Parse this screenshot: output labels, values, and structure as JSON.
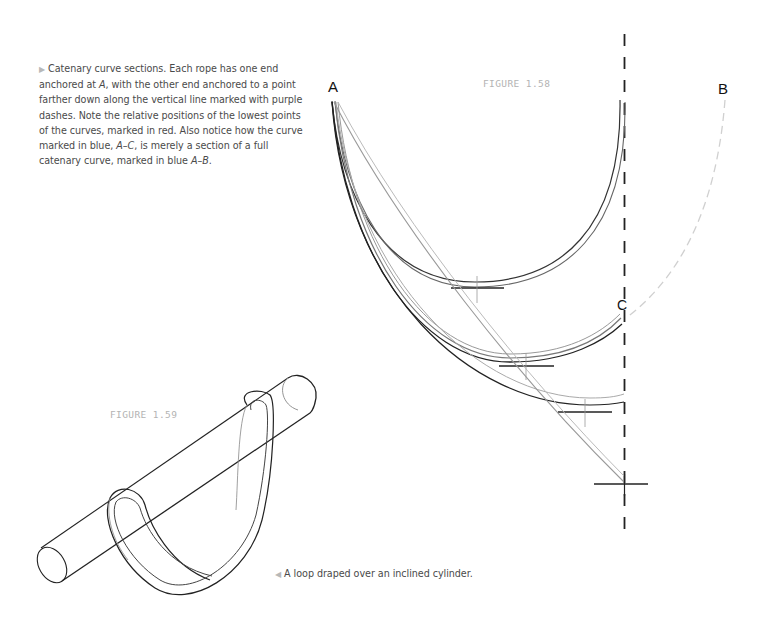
{
  "captions": {
    "figure_158": {
      "marker_icon": "▶",
      "parts": [
        "Catenary curve sections. Each rope has one end anchored at ",
        "A",
        ", with the other end anchored to a point farther down along the vertical line marked with purple dashes. Note the relative positions of the lowest points of the curves, marked in red. Also notice how the curve marked in blue, ",
        "A–C",
        ", is merely a section of a full catenary curve, marked in blue ",
        "A–B",
        "."
      ]
    },
    "figure_159": {
      "marker_icon": "◀",
      "text": "A loop draped over an inclined cylinder."
    }
  },
  "figures": {
    "figure_158": {
      "label": "FIGURE 1.58",
      "point_labels": {
        "a": "A",
        "b": "B",
        "c": "C"
      }
    },
    "figure_159": {
      "label": "FIGURE 1.59"
    }
  },
  "colors": {
    "caption_text": "#4a4a4a",
    "figure_label": "#b3b3b3",
    "point_label": "#111111",
    "dashed_line": "#222222",
    "full_catenary_dashed": "#d4d4d4",
    "curve_dark": "#333333",
    "curve_light": "#9a9a9a"
  }
}
